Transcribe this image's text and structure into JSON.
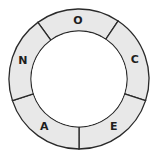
{
  "diagram": {
    "type": "ring",
    "center": [
      79,
      79
    ],
    "outer_radius": 70,
    "inner_radius": 48,
    "fill_color": "#e8e8e8",
    "stroke_color": "#2a2a2a",
    "inner_fill": "#ffffff",
    "segments": [
      {
        "label": "O",
        "start_deg": -126,
        "end_deg": -56
      },
      {
        "label": "C",
        "start_deg": -56,
        "end_deg": 18
      },
      {
        "label": "E",
        "start_deg": 18,
        "end_deg": 90
      },
      {
        "label": "A",
        "start_deg": 90,
        "end_deg": 162
      },
      {
        "label": "N",
        "start_deg": 162,
        "end_deg": 234
      }
    ]
  }
}
